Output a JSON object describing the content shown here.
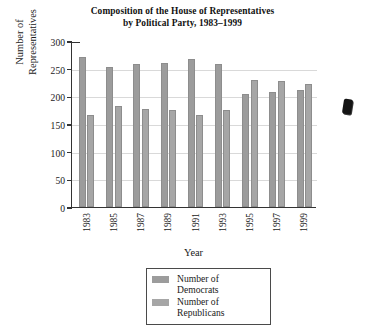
{
  "chart_data": {
    "type": "bar",
    "title": "Composition of the House of Representatives by Political Party, 1983–1999",
    "title_line1": "Composition of the House of Representatives",
    "title_line2": "by Political Party, 1983–1999",
    "xlabel": "Year",
    "ylabel": "Number of Representatives",
    "ylabel_line1": "Number of",
    "ylabel_line2": "Representatives",
    "ylim": [
      0,
      300
    ],
    "yticks": [
      0,
      50,
      100,
      150,
      200,
      250,
      300
    ],
    "grid": true,
    "legend_position": "bottom-center",
    "categories": [
      "1983",
      "1985",
      "1987",
      "1989",
      "1991",
      "1993",
      "1995",
      "1997",
      "1999"
    ],
    "series": [
      {
        "name": "Number of Democrats",
        "color": "#9c9c9c",
        "values": [
          272,
          253,
          258,
          260,
          267,
          258,
          204,
          207,
          211
        ]
      },
      {
        "name": "Number of Republicans",
        "color": "#a6a6a6",
        "values": [
          167,
          182,
          177,
          175,
          167,
          176,
          230,
          227,
          223
        ]
      }
    ]
  },
  "legend": {
    "entries": [
      {
        "label_line1": "Number of",
        "label_line2": "Democrats"
      },
      {
        "label_line1": "Number of",
        "label_line2": "Republicans"
      }
    ]
  }
}
